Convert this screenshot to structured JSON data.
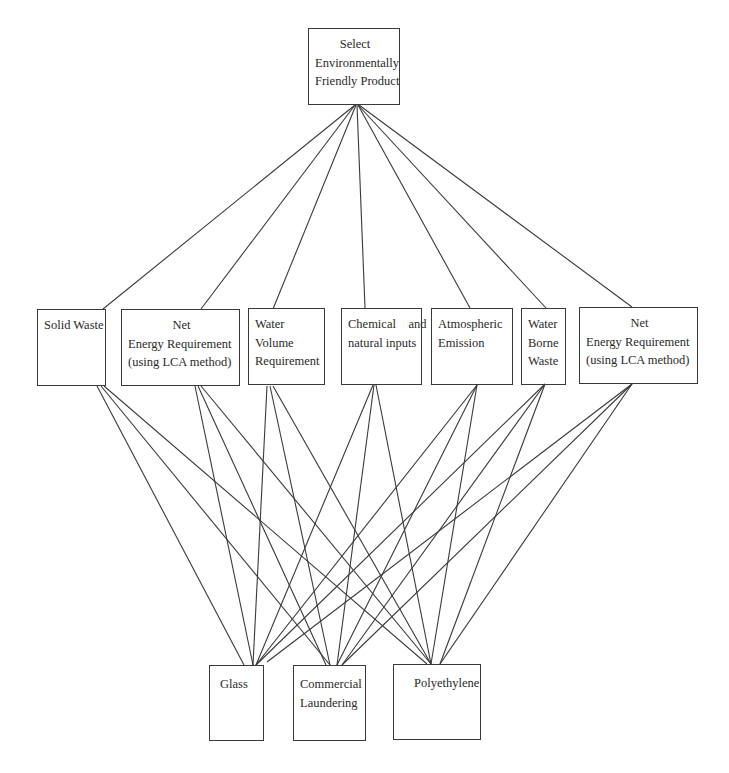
{
  "diagram": {
    "goal": {
      "id": "goal",
      "lines": [
        "Select",
        "Environmentally",
        "Friendly Product"
      ],
      "rect": [
        308,
        28,
        92,
        77
      ]
    },
    "criteria": [
      {
        "id": "solid-waste",
        "lines": [
          "Solid Waste"
        ],
        "rect": [
          37,
          309,
          69,
          77
        ],
        "align": "left"
      },
      {
        "id": "net-energy-1",
        "lines": [
          "Net",
          "Energy Requirement",
          "(using LCA method)"
        ],
        "rect": [
          121,
          309,
          119,
          77
        ],
        "align": "center-first"
      },
      {
        "id": "water-volume",
        "lines": [
          "Water",
          "Volume",
          "Requirement"
        ],
        "rect": [
          248,
          308,
          77,
          77
        ],
        "align": "left"
      },
      {
        "id": "chemical-natural-inputs",
        "lines": [
          "Chemical    and",
          "natural inputs"
        ],
        "rect": [
          341,
          308,
          81,
          77
        ],
        "align": "left"
      },
      {
        "id": "atmospheric-emission",
        "lines": [
          "Atmospheric",
          "Emission"
        ],
        "rect": [
          431,
          308,
          82,
          77
        ],
        "align": "left"
      },
      {
        "id": "water-borne-waste",
        "lines": [
          "Water",
          "Borne",
          "Waste"
        ],
        "rect": [
          521,
          308,
          45,
          77
        ],
        "align": "left"
      },
      {
        "id": "net-energy-2",
        "lines": [
          "Net",
          "Energy Requirement",
          "(using LCA method)"
        ],
        "rect": [
          579,
          307,
          119,
          77
        ],
        "align": "center-first"
      }
    ],
    "alternatives": [
      {
        "id": "glass",
        "lines": [
          "Glass"
        ],
        "rect": [
          209,
          665,
          55,
          76
        ],
        "align": "left"
      },
      {
        "id": "commercial-laundering",
        "lines": [
          "Commercial",
          "Laundering"
        ],
        "rect": [
          293,
          665,
          73,
          76
        ],
        "align": "left"
      },
      {
        "id": "polyethylene",
        "lines": [
          "Polyethylene"
        ],
        "rect": [
          393,
          664,
          88,
          76
        ],
        "align": "left"
      }
    ],
    "goal_edges": [
      [
        355,
        105,
        103,
        309
      ],
      [
        355,
        105,
        201,
        309
      ],
      [
        356,
        105,
        273,
        309
      ],
      [
        357,
        105,
        365,
        308
      ],
      [
        358,
        105,
        470,
        308
      ],
      [
        358,
        105,
        546,
        308
      ],
      [
        359,
        105,
        632,
        307
      ]
    ],
    "alternative_edges": [
      [
        97,
        386,
        244,
        665
      ],
      [
        101,
        386,
        330,
        665
      ],
      [
        104,
        386,
        427,
        664
      ],
      [
        195,
        386,
        253,
        665
      ],
      [
        198,
        386,
        326,
        665
      ],
      [
        201,
        386,
        431,
        664
      ],
      [
        267,
        386,
        253,
        665
      ],
      [
        270,
        386,
        330,
        665
      ],
      [
        273,
        386,
        431,
        664
      ],
      [
        373,
        385,
        256,
        665
      ],
      [
        374,
        385,
        337,
        665
      ],
      [
        376,
        385,
        431,
        664
      ],
      [
        477,
        385,
        256,
        665
      ],
      [
        477,
        385,
        337,
        665
      ],
      [
        477,
        385,
        431,
        664
      ],
      [
        545,
        384,
        256,
        665
      ],
      [
        545,
        384,
        342,
        665
      ],
      [
        545,
        384,
        440,
        664
      ],
      [
        632,
        384,
        267,
        662
      ],
      [
        632,
        384,
        342,
        665
      ],
      [
        632,
        384,
        440,
        664
      ]
    ]
  }
}
